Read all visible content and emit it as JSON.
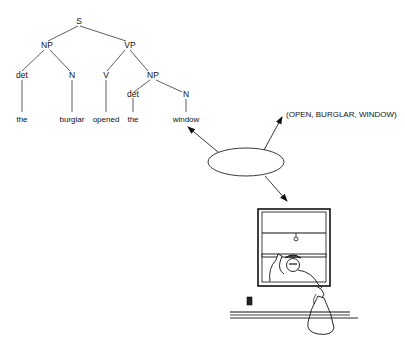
{
  "tree": {
    "root": "S",
    "nodes": {
      "s": "S",
      "np1": "NP",
      "vp": "VP",
      "det1": "det",
      "n1": "N",
      "v": "V",
      "np2": "NP",
      "det2": "det",
      "n2": "N"
    },
    "words": {
      "the1": "the",
      "burglar": "burglar",
      "opened": "opened",
      "the2": "the",
      "window": "window"
    }
  },
  "proposition": "(OPEN, BURGLAR, WINDOW)",
  "central_node": "ellipse",
  "illustration": "burglar-climbing-through-window"
}
